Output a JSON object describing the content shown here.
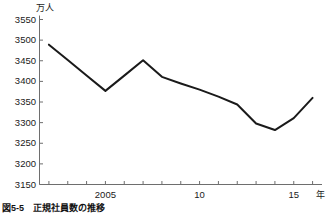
{
  "figure": {
    "caption": "図5-5　正規社員数の推移",
    "unit_label": "万人",
    "x_axis_unit": "年"
  },
  "chart_data": {
    "type": "line",
    "title": "",
    "subtitle": "",
    "xlabel": "年",
    "ylabel": "万人",
    "unit": "万人",
    "grid": false,
    "legend": null,
    "legend_position": "none",
    "xlim": [
      2001.5,
      2016.5
    ],
    "ylim": [
      3150,
      3550
    ],
    "y_ticks": [
      3150,
      3200,
      3250,
      3300,
      3350,
      3400,
      3450,
      3500,
      3550
    ],
    "y_tick_labels": [
      "3150",
      "3200",
      "3250",
      "3300",
      "3350",
      "3400",
      "3450",
      "3500",
      "3550"
    ],
    "x_ticks": [
      2002,
      2003,
      2004,
      2005,
      2006,
      2007,
      2008,
      2009,
      2010,
      2011,
      2012,
      2013,
      2014,
      2015,
      2016
    ],
    "x_tick_labels": [
      "",
      "",
      "",
      "2005",
      "",
      "",
      "",
      "",
      "10",
      "",
      "",
      "",
      "",
      "15",
      ""
    ],
    "series": [
      {
        "name": "正規社員数",
        "color": "#1a1a1a",
        "x": [
          2002,
          2003,
          2004,
          2005,
          2006,
          2007,
          2008,
          2009,
          2010,
          2011,
          2012,
          2013,
          2014,
          2015,
          2016
        ],
        "values": [
          3489,
          3452,
          3414,
          3377,
          3414,
          3451,
          3411,
          3395,
          3380,
          3363,
          3344,
          3298,
          3282,
          3311,
          3360
        ]
      }
    ],
    "annotations": []
  }
}
